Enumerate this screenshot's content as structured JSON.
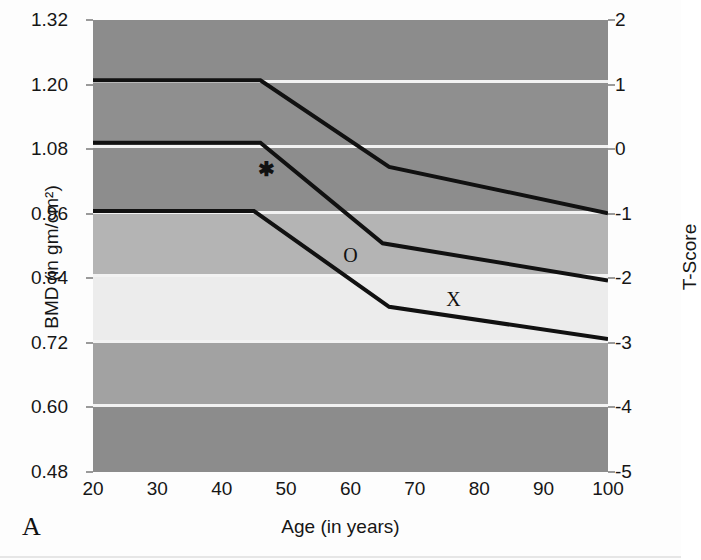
{
  "figure": {
    "panel_letter": "A",
    "background_color": "#fdfdfd"
  },
  "axes": {
    "y_left": {
      "title": "BMD (in gm/cm²)",
      "ticks": [
        "1.32",
        "1.20",
        "1.08",
        "0.96",
        "0.84",
        "0.72",
        "0.60",
        "0.48"
      ],
      "min": 0.48,
      "max": 1.32
    },
    "y_right": {
      "title": "T-Score",
      "ticks": [
        "2",
        "1",
        "0",
        "-1",
        "-2",
        "-3",
        "-4",
        "-5"
      ],
      "min": -5,
      "max": 2
    },
    "x": {
      "title": "Age (in years)",
      "ticks": [
        "20",
        "30",
        "40",
        "50",
        "60",
        "70",
        "80",
        "90",
        "100"
      ],
      "min": 20,
      "max": 100
    }
  },
  "markers": [
    {
      "name": "marker-star",
      "glyph": "✱",
      "x_age": 47,
      "y_bmd": 1.043,
      "class": "marker-star"
    },
    {
      "name": "marker-circle",
      "glyph": "O",
      "x_age": 60,
      "y_bmd": 0.884,
      "class": "marker-o"
    },
    {
      "name": "marker-cross",
      "glyph": "X",
      "x_age": 76,
      "y_bmd": 0.802,
      "class": "marker-x"
    }
  ],
  "bands": [
    {
      "name": "band-normal-upper",
      "color": "#8c8c8c",
      "y_top_bmd": 1.32,
      "y_bottom_bmd": 1.205
    },
    {
      "name": "band-normal-mid",
      "color": "#8f8f8f",
      "y_top_bmd": 1.205,
      "y_bottom_bmd": 1.085
    },
    {
      "name": "band-normal-lower",
      "color": "#8d8d8d",
      "y_top_bmd": 1.085,
      "y_bottom_bmd": 0.962
    },
    {
      "name": "band-osteopenia",
      "color": "#b4b4b4",
      "y_top_bmd": 0.962,
      "y_bottom_bmd": 0.845
    },
    {
      "name": "band-osteoporosis",
      "color": "#ececec",
      "y_top_bmd": 0.845,
      "y_bottom_bmd": 0.723
    },
    {
      "name": "band-severe-upper",
      "color": "#a2a2a2",
      "y_top_bmd": 0.723,
      "y_bottom_bmd": 0.603
    },
    {
      "name": "band-severe-lower",
      "color": "#8c8c8c",
      "y_top_bmd": 0.603,
      "y_bottom_bmd": 0.48
    }
  ],
  "gridlines_bmd": [
    1.205,
    1.085,
    0.962,
    0.845,
    0.723,
    0.603
  ],
  "chart_data": {
    "type": "line",
    "title": "",
    "subtitle": "",
    "xlabel": "Age (in years)",
    "ylabel": "BMD (in gm/cm²)",
    "y2label": "T-Score",
    "xlim": [
      20,
      100
    ],
    "ylim": [
      0.48,
      1.32
    ],
    "y2lim": [
      -5,
      2
    ],
    "xticks": [
      20,
      30,
      40,
      50,
      60,
      70,
      80,
      90,
      100
    ],
    "yticks": [
      0.48,
      0.6,
      0.72,
      0.84,
      0.96,
      1.08,
      1.2,
      1.32
    ],
    "y2ticks": [
      -5,
      -4,
      -3,
      -2,
      -1,
      0,
      1,
      2
    ],
    "grid": true,
    "legend": "none",
    "line_color": "#111111",
    "line_width_px": 4,
    "series": [
      {
        "name": "Upper percentile curve (marker *)",
        "marker_label": "*",
        "x": [
          20,
          46,
          66,
          100
        ],
        "y": [
          1.208,
          1.208,
          1.047,
          0.961
        ],
        "t_score": [
          1.25,
          1.25,
          -0.1,
          -0.83
        ]
      },
      {
        "name": "Middle percentile curve (marker O)",
        "marker_label": "O",
        "x": [
          20,
          46,
          65,
          100
        ],
        "y": [
          1.092,
          1.092,
          0.905,
          0.836
        ],
        "t_score": [
          0.3,
          0.3,
          -1.27,
          -1.85
        ]
      },
      {
        "name": "Lower percentile curve (marker X)",
        "marker_label": "X",
        "x": [
          20,
          45,
          66,
          100
        ],
        "y": [
          0.965,
          0.965,
          0.787,
          0.727
        ],
        "t_score": [
          -0.75,
          -0.75,
          -2.25,
          -2.76
        ]
      }
    ]
  }
}
